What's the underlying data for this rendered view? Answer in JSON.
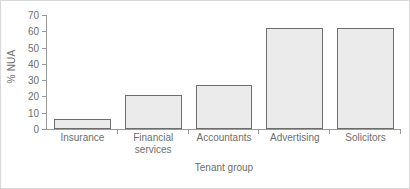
{
  "chart_data": {
    "type": "bar",
    "title": "",
    "xlabel": "Tenant group",
    "ylabel": "% NUA",
    "categories": [
      "Insurance",
      "Financial services",
      "Accountants",
      "Advertising",
      "Solicitors"
    ],
    "category_lines": [
      [
        "Insurance"
      ],
      [
        "Financial",
        "services"
      ],
      [
        "Accountants"
      ],
      [
        "Advertising"
      ],
      [
        "Solicitors"
      ]
    ],
    "values": [
      6,
      21,
      27,
      62,
      62
    ],
    "ylim": [
      0,
      70
    ],
    "ytick_values": [
      0,
      10,
      20,
      30,
      40,
      50,
      60,
      70
    ],
    "ytick_labels": [
      "0",
      "10",
      "20",
      "30",
      "40",
      "50",
      "60",
      "70"
    ],
    "grid": false,
    "legend": false,
    "bar_fill_color": "#ebebeb",
    "bar_border_color": "#6d6d6d",
    "axis_color": "#9a9a9a",
    "text_color": "#6e6e6e"
  }
}
